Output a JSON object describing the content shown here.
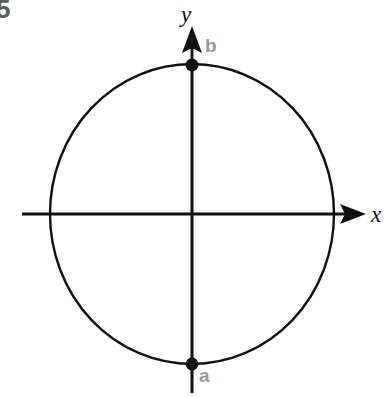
{
  "figure": {
    "problem_number": "5",
    "background_color": "#ffffff",
    "stroke_color": "#111111",
    "label_gray": "#9a9a9a",
    "number_gray": "#5b5b5b"
  },
  "axes": {
    "x_label": "x",
    "y_label": "y",
    "origin": {
      "x": 192,
      "y": 214
    },
    "x_axis": {
      "start_x": 22,
      "end_x": 366,
      "y": 214,
      "arrow": "arrow-right"
    },
    "y_axis": {
      "x": 192,
      "start_y": 26,
      "end_y": 393,
      "arrow": "arrow-up"
    }
  },
  "circle": {
    "center": {
      "x": 192,
      "y": 214
    },
    "radius_x": 142,
    "radius_y": 150,
    "stroke_width": 2,
    "fill": "none"
  },
  "points": [
    {
      "id": "b",
      "label": "b",
      "x": 192,
      "y": 65,
      "position": "top",
      "dot_radius": 6
    },
    {
      "id": "a",
      "label": "a",
      "x": 192,
      "y": 364,
      "position": "bottom",
      "dot_radius": 6
    }
  ]
}
